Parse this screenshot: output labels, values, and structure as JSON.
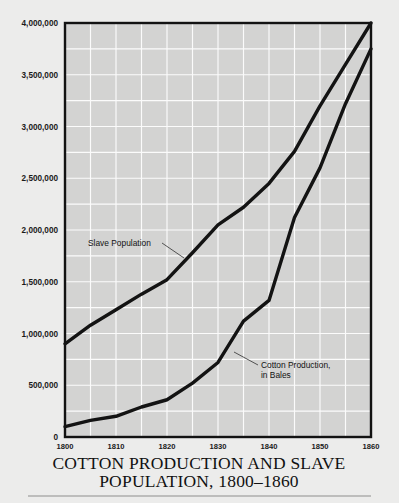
{
  "title": {
    "line1": "COTTON PRODUCTION AND SLAVE",
    "line2": "POPULATION, 1800–1860"
  },
  "annotations": {
    "slave": {
      "line1": "Slave Population"
    },
    "cotton": {
      "line1": "Cotton Production,",
      "line2": "in Bales"
    }
  },
  "colors": {
    "page_background": "#ececeb",
    "plot_background": "#d3d3d2",
    "gridline": "#fbfbfb",
    "axis": "#121212",
    "line": "#131313",
    "text": "#111111",
    "rule": "#8d8d8d"
  },
  "chart_data": {
    "type": "line",
    "xlabel": "",
    "ylabel": "",
    "xlim": [
      1800,
      1860
    ],
    "ylim": [
      0,
      4000000
    ],
    "grid": true,
    "legend_position": "inline-annotations",
    "xticks": [
      1800,
      1810,
      1820,
      1830,
      1840,
      1850,
      1860
    ],
    "xtick_labels": [
      "1800",
      "1810",
      "1820",
      "1830",
      "1840",
      "1850",
      "1860"
    ],
    "x_minor_step": 5,
    "yticks": [
      0,
      500000,
      1000000,
      1500000,
      2000000,
      2500000,
      3000000,
      3500000,
      4000000
    ],
    "ytick_labels": [
      "0",
      "500,000",
      "1,000,000",
      "1,500,000",
      "2,000,000",
      "2,500,000",
      "3,000,000",
      "3,500,000",
      "4,000,000"
    ],
    "y_minor_step": 250000,
    "x": [
      1800,
      1805,
      1810,
      1815,
      1820,
      1825,
      1830,
      1835,
      1840,
      1845,
      1850,
      1855,
      1860
    ],
    "series": [
      {
        "name": "Slave Population",
        "values": [
          900000,
          1080000,
          1230000,
          1380000,
          1520000,
          1780000,
          2050000,
          2220000,
          2450000,
          2760000,
          3200000,
          3600000,
          4000000
        ]
      },
      {
        "name": "Cotton Production, in Bales",
        "values": [
          100000,
          160000,
          200000,
          290000,
          360000,
          520000,
          720000,
          1120000,
          1320000,
          2120000,
          2600000,
          3220000,
          3750000
        ]
      }
    ]
  }
}
